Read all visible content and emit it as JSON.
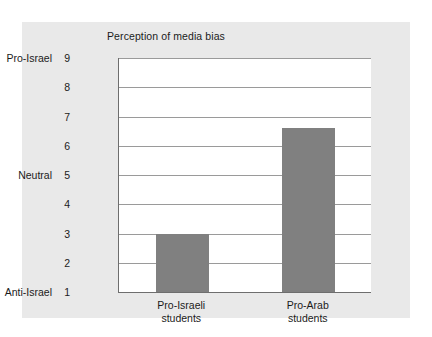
{
  "chart_data": {
    "type": "bar",
    "title": "Perception of media bias",
    "xlabel": "",
    "ylabel": "",
    "categories": [
      "Pro-Israeli students",
      "Pro-Arab students"
    ],
    "category_lines": [
      [
        "Pro-Israeli",
        "students"
      ],
      [
        "Pro-Arab",
        "students"
      ]
    ],
    "values": [
      3.0,
      6.6
    ],
    "ylim": [
      1,
      9
    ],
    "yticks": [
      "9",
      "8",
      "7",
      "6",
      "5",
      "4",
      "3",
      "2",
      "1"
    ],
    "y_anchor_labels": [
      {
        "value": "9",
        "label": "Pro-Israel"
      },
      {
        "value": "5",
        "label": "Neutral"
      },
      {
        "value": "1",
        "label": "Anti-Israel"
      }
    ],
    "grid": true,
    "legend": "none",
    "colors": {
      "bar_fill": "#808080",
      "figure_background": "#e9e9e9",
      "plot_background": "#ffffff",
      "axis_line": "#6e6e6e",
      "gridline": "#9a9a9a",
      "text": "#1b1b1b"
    }
  }
}
